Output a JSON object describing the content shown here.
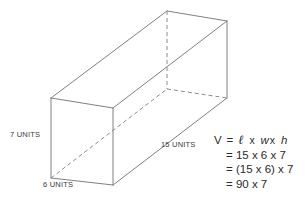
{
  "figure": {
    "type": "rectangular-prism-volume-diagram",
    "shape_name": "rectangular prism",
    "line_color": "#808080",
    "text_color": "#2b2b2b",
    "background": "#ffffff"
  },
  "labels": {
    "height": "7 UNITS",
    "depth": "6 UNITS",
    "length": "15 UNITS"
  },
  "dimensions": {
    "length": 15,
    "width": 6,
    "height": 7,
    "unit": "UNITS"
  },
  "formula": {
    "line1": {
      "lhs": "V",
      "equals": "=",
      "v1": "ℓ",
      "x1": "x",
      "v2": "w",
      "x2": "x",
      "v3": "h"
    },
    "line2": "= 15 x 6 x 7",
    "line3": "= (15 x 6) x 7",
    "line4": "= 90 x 7"
  },
  "result": {
    "partial_product": 90,
    "volume": 630
  }
}
